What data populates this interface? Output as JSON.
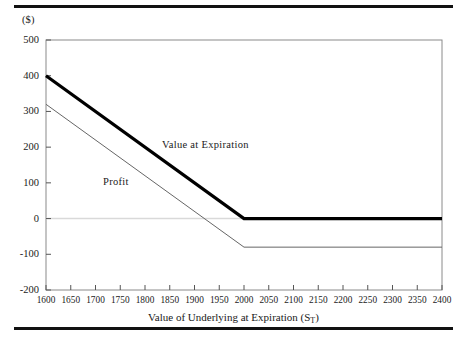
{
  "figure": {
    "unit_label": "($)",
    "top_rule": "rule",
    "bottom_rule": "rule"
  },
  "chart_data": {
    "type": "line",
    "title": "",
    "subtitle": "",
    "xlabel": "Value of Underlying at Expiration (S",
    "xlabel_subscript": "T",
    "xlabel_suffix": ")",
    "ylabel": "($)",
    "xlim": [
      1600,
      2400
    ],
    "ylim": [
      -200,
      500
    ],
    "xticks": [
      1600,
      1650,
      1700,
      1750,
      1800,
      1850,
      1900,
      1950,
      2000,
      2050,
      2100,
      2150,
      2200,
      2250,
      2300,
      2350,
      2400
    ],
    "yticks": [
      500,
      400,
      300,
      200,
      100,
      0,
      -100,
      -200
    ],
    "grid": false,
    "zero_line": true,
    "zero_line_color": "#d9d9d9",
    "legend_position": "inline-annotations",
    "series": [
      {
        "name": "Value at Expiration",
        "color": "#000000",
        "width": 3.2,
        "x": [
          1600,
          2000,
          2400
        ],
        "values": [
          400,
          0,
          0
        ]
      },
      {
        "name": "Profit",
        "color": "#666666",
        "width": 1.0,
        "x": [
          1600,
          2000,
          2400
        ],
        "values": [
          320,
          -80,
          -80
        ]
      }
    ],
    "annotations": [
      {
        "text": "Value at Expiration",
        "x": 1955,
        "y": 195
      },
      {
        "text": "Profit",
        "x": 1830,
        "y": 95
      }
    ]
  }
}
